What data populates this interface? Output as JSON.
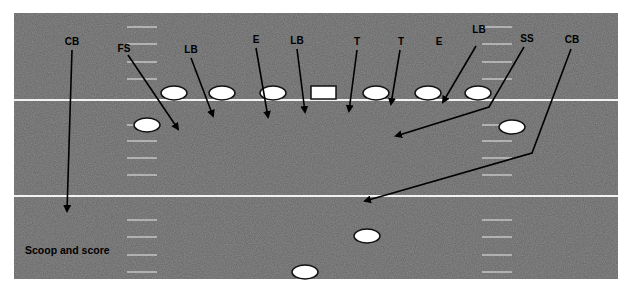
{
  "colors": {
    "field": "#8b8b8b",
    "line": "#f2f2f2",
    "hash": "#d8d8d8",
    "player_fill": "#ffffff",
    "player_stroke": "#111111",
    "arrow": "#000000",
    "label": "#000000"
  },
  "field": {
    "x": 14,
    "y": 13,
    "width": 604,
    "height": 266
  },
  "yard_lines": [
    100,
    196
  ],
  "hash_marks": {
    "left_x": [
      127,
      157
    ],
    "right_x": [
      482,
      512
    ],
    "y": [
      27,
      44,
      62,
      79,
      125,
      141,
      158,
      175,
      220,
      237,
      255,
      272
    ]
  },
  "offense": {
    "center": {
      "x": 311,
      "y": 86,
      "width": 25,
      "height": 13
    },
    "players": [
      {
        "cx": 174,
        "cy": 93
      },
      {
        "cx": 222,
        "cy": 93
      },
      {
        "cx": 273,
        "cy": 93
      },
      {
        "cx": 376,
        "cy": 93
      },
      {
        "cx": 428,
        "cy": 93
      },
      {
        "cx": 478,
        "cy": 93
      },
      {
        "cx": 147,
        "cy": 125
      },
      {
        "cx": 512,
        "cy": 127
      },
      {
        "cx": 367,
        "cy": 236
      },
      {
        "cx": 305,
        "cy": 272
      }
    ]
  },
  "defense": [
    {
      "label": "CB",
      "lx": 72,
      "ly": 45,
      "path": [
        [
          72,
          50
        ],
        [
          67,
          211
        ]
      ]
    },
    {
      "label": "FS",
      "lx": 124,
      "ly": 52,
      "path": [
        [
          128,
          55
        ],
        [
          178,
          129
        ]
      ]
    },
    {
      "label": "LB",
      "lx": 191,
      "ly": 53,
      "path": [
        [
          191,
          58
        ],
        [
          213,
          116
        ]
      ]
    },
    {
      "label": "E",
      "lx": 256,
      "ly": 43,
      "path": [
        [
          256,
          48
        ],
        [
          268,
          117
        ]
      ]
    },
    {
      "label": "LB",
      "lx": 297,
      "ly": 44,
      "path": [
        [
          297,
          49
        ],
        [
          305,
          112
        ]
      ]
    },
    {
      "label": "T",
      "lx": 357,
      "ly": 45,
      "path": [
        [
          357,
          50
        ],
        [
          349,
          111
        ]
      ]
    },
    {
      "label": "T",
      "lx": 401,
      "ly": 45,
      "path": [
        [
          400,
          50
        ],
        [
          391,
          104
        ]
      ]
    },
    {
      "label": "E",
      "lx": 439,
      "ly": 45,
      "path": []
    },
    {
      "label": "LB",
      "lx": 479,
      "ly": 33,
      "path": [
        [
          476,
          46
        ],
        [
          443,
          102
        ]
      ]
    },
    {
      "label": "SS",
      "lx": 527,
      "ly": 42,
      "path": [
        [
          524,
          47
        ],
        [
          489,
          107
        ],
        [
          396,
          136
        ]
      ]
    },
    {
      "label": "CB",
      "lx": 572,
      "ly": 43,
      "path": [
        [
          571,
          49
        ],
        [
          532,
          153
        ],
        [
          365,
          201
        ]
      ]
    }
  ],
  "annotation": {
    "text": "Scoop and score",
    "x": 25,
    "y": 254
  }
}
